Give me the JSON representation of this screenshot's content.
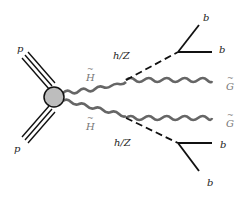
{
  "diagram": {
    "type": "feynman",
    "colors": {
      "line": "#111111",
      "wavy": "#666666",
      "blob_fill": "#bdbdbd",
      "blob_stroke": "#111111",
      "label": "#222222",
      "label_soft": "#777777"
    },
    "labels": {
      "proton_top": "p",
      "proton_bottom": "p",
      "higgsino_top": "H",
      "higgsino_bottom": "H",
      "boson_top": "h/Z",
      "boson_bottom": "h/Z",
      "b_top_1": "b",
      "b_top_2": "b",
      "b_bottom_1": "b",
      "b_bottom_2": "b",
      "gravitino_top": "G",
      "gravitino_bottom": "G"
    },
    "nodes": {
      "blob": {
        "x": 54,
        "y": 97,
        "r": 10
      },
      "decay_top": {
        "x": 126,
        "y": 80
      },
      "decay_bottom": {
        "x": 126,
        "y": 118
      },
      "bjet_top": {
        "x": 178,
        "y": 52
      },
      "bjet_bottom": {
        "x": 178,
        "y": 143
      }
    }
  }
}
